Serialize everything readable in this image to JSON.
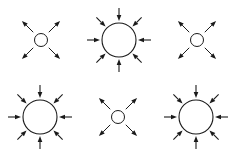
{
  "figure": {
    "background_color": "#ffffff",
    "stroke_color": "#1a1a1a",
    "circle_fill": "#ffffff",
    "width": 236,
    "height": 155,
    "grid": {
      "columns": 3,
      "rows": 2,
      "cell_width": 78.7,
      "cell_height": 77.5
    }
  },
  "panels": [
    {
      "id": "panel-1",
      "label": "Small circle with four outward diagonal arrows",
      "kind": "outward",
      "arrow_count": 4,
      "center": {
        "x": 41,
        "y": 40
      },
      "circle_radius": 6.5,
      "stroke_width": 1,
      "arrow_start_radius": 11,
      "arrow_end_radius": 27,
      "head_length": 6,
      "head_width": 4.4,
      "angles_deg": [
        45,
        135,
        225,
        315
      ]
    },
    {
      "id": "panel-2",
      "label": "Large circle with eight inward arrows",
      "kind": "inward",
      "arrow_count": 8,
      "center": {
        "x": 119,
        "y": 40
      },
      "circle_radius": 17,
      "stroke_width": 1.1,
      "arrow_start_radius": 32,
      "arrow_end_radius": 19,
      "head_length": 6,
      "head_width": 4.6,
      "angles_deg": [
        0,
        45,
        90,
        135,
        180,
        225,
        270,
        315
      ]
    },
    {
      "id": "panel-3",
      "label": "Small circle with four outward diagonal arrows",
      "kind": "outward",
      "arrow_count": 4,
      "center": {
        "x": 197,
        "y": 40
      },
      "circle_radius": 6.5,
      "stroke_width": 1,
      "arrow_start_radius": 11,
      "arrow_end_radius": 27,
      "head_length": 6,
      "head_width": 4.4,
      "angles_deg": [
        45,
        135,
        225,
        315
      ]
    },
    {
      "id": "panel-4",
      "label": "Large circle with eight inward arrows",
      "kind": "inward",
      "arrow_count": 8,
      "center": {
        "x": 40,
        "y": 117
      },
      "circle_radius": 17,
      "stroke_width": 1.1,
      "arrow_start_radius": 32,
      "arrow_end_radius": 19,
      "head_length": 6,
      "head_width": 4.6,
      "angles_deg": [
        0,
        45,
        90,
        135,
        180,
        225,
        270,
        315
      ]
    },
    {
      "id": "panel-5",
      "label": "Small circle with four outward diagonal arrows",
      "kind": "outward",
      "arrow_count": 4,
      "center": {
        "x": 118,
        "y": 117
      },
      "circle_radius": 6.5,
      "stroke_width": 1,
      "arrow_start_radius": 11,
      "arrow_end_radius": 27,
      "head_length": 6,
      "head_width": 4.4,
      "angles_deg": [
        45,
        135,
        225,
        315
      ]
    },
    {
      "id": "panel-6",
      "label": "Large circle with eight inward arrows",
      "kind": "inward",
      "arrow_count": 8,
      "center": {
        "x": 196,
        "y": 117
      },
      "circle_radius": 17,
      "stroke_width": 1.1,
      "arrow_start_radius": 32,
      "arrow_end_radius": 19,
      "head_length": 6,
      "head_width": 4.6,
      "angles_deg": [
        0,
        45,
        90,
        135,
        180,
        225,
        270,
        315
      ]
    }
  ]
}
